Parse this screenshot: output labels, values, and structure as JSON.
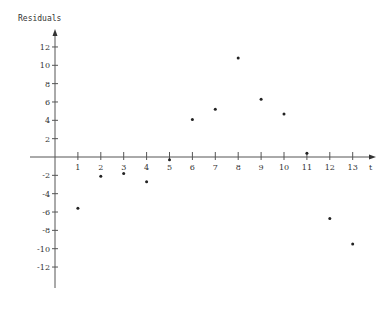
{
  "chart_data": {
    "type": "scatter",
    "title": "",
    "xlabel": "t",
    "ylabel": "Residuals",
    "x": [
      1,
      2,
      3,
      4,
      5,
      6,
      7,
      8,
      9,
      10,
      11,
      12,
      13
    ],
    "series": [
      {
        "name": "Residuals",
        "values": [
          -5.6,
          -2.1,
          -1.8,
          -2.7,
          -0.3,
          4.1,
          5.2,
          10.8,
          6.3,
          4.7,
          0.4,
          -6.7,
          -9.5
        ]
      }
    ],
    "x_ticks": [
      "1",
      "2",
      "3",
      "4",
      "5",
      "6",
      "7",
      "8",
      "9",
      "10",
      "11",
      "12",
      "13"
    ],
    "y_ticks": [
      "12",
      "10",
      "8",
      "6",
      "4",
      "2",
      "-2",
      "-4",
      "-6",
      "-8",
      "-10",
      "-12"
    ],
    "y_tick_values": [
      12,
      10,
      8,
      6,
      4,
      2,
      -2,
      -4,
      -6,
      -8,
      -10,
      -12
    ],
    "xlim": [
      0,
      14
    ],
    "ylim": [
      -14,
      13.5
    ],
    "grid": false,
    "legend": "none"
  }
}
